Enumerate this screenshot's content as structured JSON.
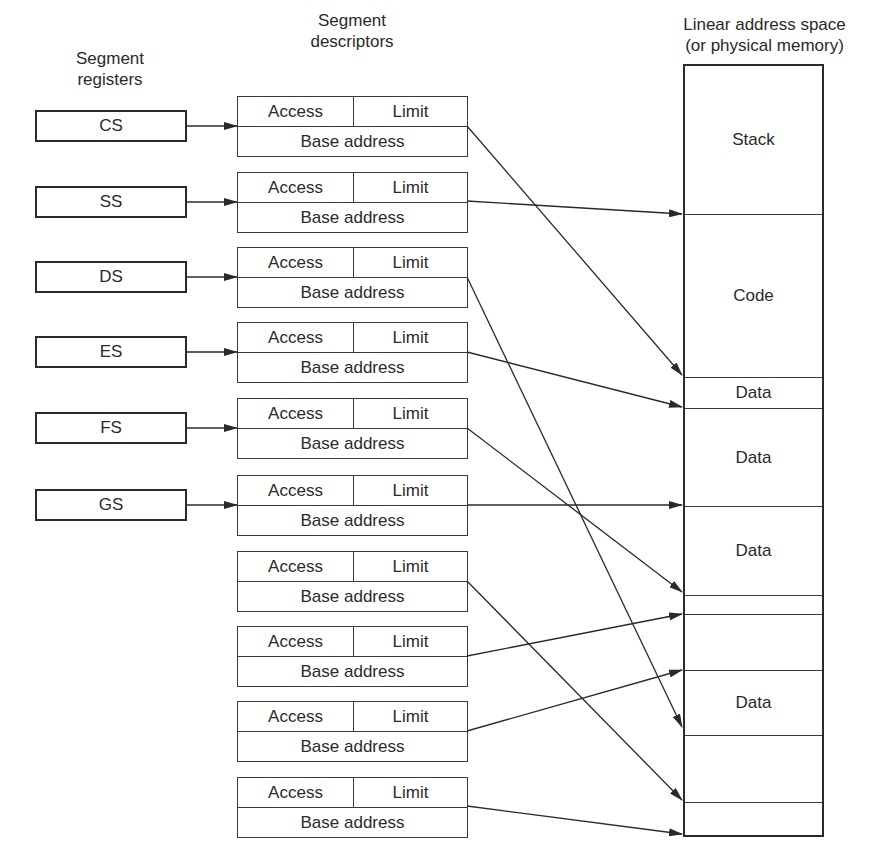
{
  "headings": {
    "registers": [
      "Segment",
      "registers"
    ],
    "descriptors": [
      "Segment",
      "descriptors"
    ],
    "memory": [
      "Linear address space",
      "(or physical memory)"
    ]
  },
  "registers": [
    {
      "label": "CS",
      "top": 110
    },
    {
      "label": "SS",
      "top": 186
    },
    {
      "label": "DS",
      "top": 261
    },
    {
      "label": "ES",
      "top": 336
    },
    {
      "label": "FS",
      "top": 412
    },
    {
      "label": "GS",
      "top": 489
    }
  ],
  "descriptors": [
    {
      "access": "Access",
      "limit": "Limit",
      "base": "Base address",
      "top": 96
    },
    {
      "access": "Access",
      "limit": "Limit",
      "base": "Base address",
      "top": 172
    },
    {
      "access": "Access",
      "limit": "Limit",
      "base": "Base address",
      "top": 247
    },
    {
      "access": "Access",
      "limit": "Limit",
      "base": "Base address",
      "top": 322
    },
    {
      "access": "Access",
      "limit": "Limit",
      "base": "Base address",
      "top": 398
    },
    {
      "access": "Access",
      "limit": "Limit",
      "base": "Base address",
      "top": 475
    },
    {
      "access": "Access",
      "limit": "Limit",
      "base": "Base address",
      "top": 551
    },
    {
      "access": "Access",
      "limit": "Limit",
      "base": "Base address",
      "top": 626
    },
    {
      "access": "Access",
      "limit": "Limit",
      "base": "Base address",
      "top": 701
    },
    {
      "access": "Access",
      "limit": "Limit",
      "base": "Base address",
      "top": 777
    }
  ],
  "memory_segments": [
    {
      "label": "Stack",
      "top": 0,
      "height": 149
    },
    {
      "label": "Code",
      "top": 149,
      "height": 163
    },
    {
      "label": "Data",
      "top": 312,
      "height": 31
    },
    {
      "label": "Data",
      "top": 343,
      "height": 98
    },
    {
      "label": "Data",
      "top": 441,
      "height": 89
    },
    {
      "label": "",
      "top": 530,
      "height": 19
    },
    {
      "label": "",
      "top": 549,
      "height": 56
    },
    {
      "label": "Data",
      "top": 605,
      "height": 65
    },
    {
      "label": "",
      "top": 670,
      "height": 67
    },
    {
      "label": "",
      "top": 737,
      "height": 32
    }
  ],
  "register_arrows": [
    {
      "from": "CS",
      "y": 126
    },
    {
      "from": "SS",
      "y": 202
    },
    {
      "from": "DS",
      "y": 277
    },
    {
      "from": "ES",
      "y": 352
    },
    {
      "from": "FS",
      "y": 428
    },
    {
      "from": "GS",
      "y": 505
    }
  ],
  "descriptor_arrows": [
    {
      "from_y": 126,
      "to_y": 375
    },
    {
      "from_y": 201,
      "to_y": 214
    },
    {
      "from_y": 277,
      "to_y": 727
    },
    {
      "from_y": 352,
      "to_y": 407
    },
    {
      "from_y": 428,
      "to_y": 592
    },
    {
      "from_y": 505,
      "to_y": 505
    },
    {
      "from_y": 581,
      "to_y": 800
    },
    {
      "from_y": 656,
      "to_y": 614
    },
    {
      "from_y": 731,
      "to_y": 670
    },
    {
      "from_y": 806,
      "to_y": 834
    }
  ],
  "colors": {
    "line": "#2a2a2a",
    "background": "#ffffff"
  }
}
